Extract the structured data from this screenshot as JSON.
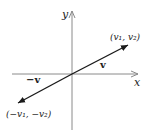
{
  "diagram": {
    "axes": {
      "x_label": "x",
      "y_label": "y"
    },
    "vectors": [
      {
        "name": "v",
        "label": "v",
        "endpoint_label": "(v₁, v₂)"
      },
      {
        "name": "neg-v",
        "label": "−v",
        "endpoint_label": "(−v₁, −v₂)"
      }
    ],
    "colors": {
      "axis": "#8a8a8a",
      "vector": "#1a1a1a"
    }
  }
}
